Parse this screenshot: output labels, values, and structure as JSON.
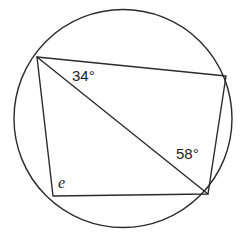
{
  "figure": {
    "type": "cyclic-quadrilateral-in-circle",
    "stroke_color": "#2b2b2b",
    "background_color": "#ffffff",
    "circle": {
      "center_x": 123,
      "center_y": 118.5,
      "radius": 109
    },
    "vertices": [
      {
        "name": "top-left",
        "x": 37,
        "y": 57
      },
      {
        "name": "top-right",
        "x": 226,
        "y": 76
      },
      {
        "name": "bottom-right",
        "x": 208,
        "y": 194
      },
      {
        "name": "bottom-left",
        "x": 53,
        "y": 196
      }
    ],
    "quadrilateral_path": "M 37 57 L 226 76 L 208 194 L 53 196 Z",
    "diagonal": {
      "name": "diagonal-top-left-to-bottom-right",
      "x1": 37,
      "y1": 57,
      "x2": 208,
      "y2": 194
    },
    "labels": {
      "angle_a": "34°",
      "angle_b": "58°",
      "angle_e": "e"
    }
  }
}
